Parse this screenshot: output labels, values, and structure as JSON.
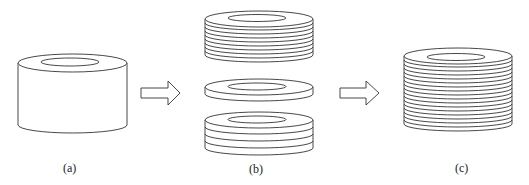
{
  "figure": {
    "panels": [
      {
        "id": "a",
        "label": "(a)",
        "description": "solid cylindrical ring (hollow cylinder)"
      },
      {
        "id": "b",
        "label": "(b)",
        "description": "ring sliced into stacks of thin disks: top stack of many layers, single disk, bottom stack of few layers"
      },
      {
        "id": "c",
        "label": "(c)",
        "description": "reassembled laminated ring made of many thin layers"
      }
    ],
    "arrows": [
      {
        "from": "a",
        "to": "b"
      },
      {
        "from": "b",
        "to": "c"
      }
    ],
    "colors": {
      "stroke": "#333333",
      "fill": "#ffffff"
    }
  }
}
